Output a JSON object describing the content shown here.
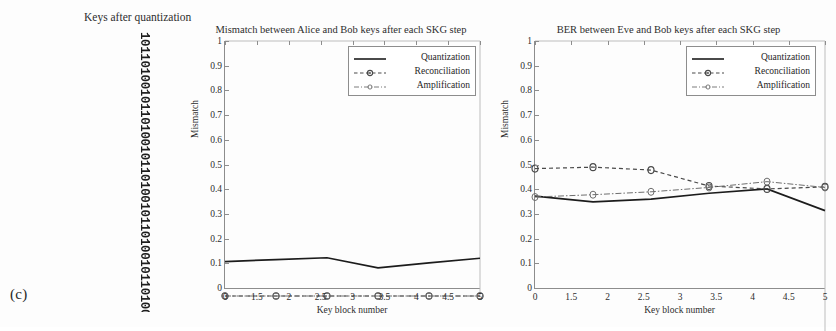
{
  "figure": {
    "panel_label": "(c)",
    "keystrip": {
      "caption": "Keys after quantization",
      "bits": "10110100101101001011010010110100101101001011010010110100101101001011010010110100101101001011010010110100101101001011010010110100101101001011"
    }
  },
  "charts": [
    {
      "id": "mismatch-alice-bob",
      "title": "Mismatch between Alice and Bob keys after each SKG step",
      "xlabel": "Key block number",
      "ylabel": "Mismatch",
      "legend_position": "top-right",
      "legend": [
        "Quantization",
        "Reconciliation",
        "Amplification"
      ]
    },
    {
      "id": "ber-eve-bob",
      "title": "BER between Eve and Bob keys after each SKG step",
      "xlabel": "Key block number",
      "ylabel": "Mismatch",
      "legend_position": "top-right",
      "legend": [
        "Quantization",
        "Reconciliation",
        "Amplification"
      ]
    }
  ],
  "chart_data": [
    {
      "type": "line",
      "id": "mismatch-alice-bob",
      "title": "Mismatch between Alice and Bob keys after each SKG step",
      "xlabel": "Key block number",
      "ylabel": "Mismatch",
      "xlim": [
        0,
        5
      ],
      "ylim": [
        0,
        1
      ],
      "grid": false,
      "legend_position": "upper right",
      "xticklabels": [
        "0",
        "1.5",
        "2",
        "2.5",
        "3",
        "3.5",
        "4",
        "4.5",
        "5"
      ],
      "yticklabels": [
        "0",
        "0.1",
        "0.2",
        "0.3",
        "0.4",
        "0.5",
        "0.6",
        "0.7",
        "0.8",
        "0.9",
        "1"
      ],
      "x": [
        0,
        1,
        2,
        3,
        4,
        5
      ],
      "series": [
        {
          "name": "Quantization",
          "style": "solid",
          "marker": "none",
          "values": [
            0.135,
            0.143,
            0.15,
            0.11,
            0.13,
            0.148
          ]
        },
        {
          "name": "Reconciliation",
          "style": "dashed",
          "marker": "circle",
          "values": [
            0,
            0,
            0,
            0,
            0,
            0
          ]
        },
        {
          "name": "Amplification",
          "style": "dashdot",
          "marker": "circle",
          "values": [
            0,
            0,
            0,
            0,
            0,
            0
          ]
        }
      ]
    },
    {
      "type": "line",
      "id": "ber-eve-bob",
      "title": "BER between Eve and Bob keys after each SKG step",
      "xlabel": "Key block number",
      "ylabel": "Mismatch",
      "xlim": [
        0,
        5
      ],
      "ylim": [
        0,
        1
      ],
      "grid": false,
      "legend_position": "upper right",
      "xticklabels": [
        "0",
        "1.5",
        "2",
        "2.5",
        "3",
        "3.5",
        "4",
        "4.5",
        "5"
      ],
      "yticklabels": [
        "0",
        "0.1",
        "0.2",
        "0.3",
        "0.4",
        "0.5",
        "0.6",
        "0.7",
        "0.8",
        "0.9",
        "1"
      ],
      "x": [
        0,
        1,
        2,
        3,
        4,
        5
      ],
      "series": [
        {
          "name": "Quantization",
          "style": "solid",
          "marker": "none",
          "values": [
            0.465,
            0.445,
            0.455,
            0.475,
            0.49,
            0.415
          ]
        },
        {
          "name": "Reconciliation",
          "style": "dashed",
          "marker": "circle",
          "values": [
            0.56,
            0.565,
            0.555,
            0.5,
            0.49,
            0.497
          ]
        },
        {
          "name": "Amplification",
          "style": "dashdot",
          "marker": "circle",
          "values": [
            0.462,
            0.47,
            0.48,
            0.495,
            0.515,
            0.495
          ]
        }
      ]
    }
  ]
}
